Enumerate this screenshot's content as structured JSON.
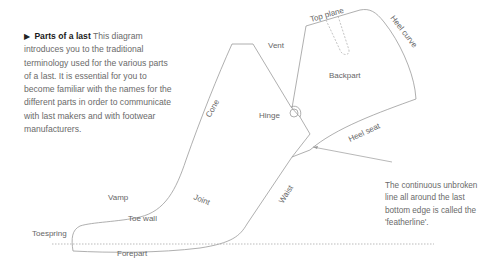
{
  "intro": {
    "bullet": "▶",
    "heading": "Parts of a last",
    "text": " This diagram introduces you to the traditional terminology used for the various parts of a last. It is essential for you to become familiar with the names for the different parts in order to communicate with last makers and with footwear manufacturers."
  },
  "labels": {
    "top_plane": "Top plane",
    "heel_curve": "Heel curve",
    "vent": "Vent",
    "backpart": "Backpart",
    "cone": "Cone",
    "hinge": "Hinge",
    "heel_seat": "Heel seat",
    "vamp": "Vamp",
    "joint": "Joint",
    "toe_wall": "Toe wall",
    "waist": "Waist",
    "toespring": "Toespring",
    "forepart": "Forepart"
  },
  "note": {
    "text": "The continuous unbroken line all around the last bottom edge is called the 'featherline'."
  },
  "colors": {
    "outline": "#9a9a9a",
    "text": "#666666",
    "heading": "#1a1a1a"
  }
}
